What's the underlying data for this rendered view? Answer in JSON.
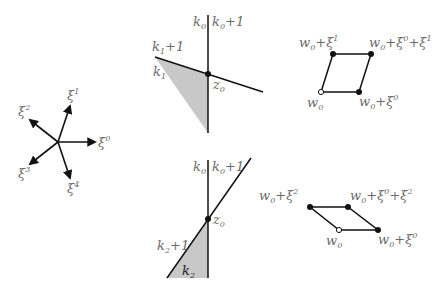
{
  "star": {
    "center": [
      58,
      142
    ],
    "vectors": [
      {
        "name": "ξ",
        "index": "0",
        "tip": [
          96,
          142
        ],
        "label_pos": [
          98,
          147
        ]
      },
      {
        "name": "ξ",
        "index": "1",
        "tip": [
          70,
          105
        ],
        "label_pos": [
          68,
          99
        ]
      },
      {
        "name": "ξ",
        "index": "2",
        "tip": [
          29,
          119
        ],
        "label_pos": [
          17,
          115
        ]
      },
      {
        "name": "ξ",
        "index": "3",
        "tip": [
          29,
          165
        ],
        "label_pos": [
          17,
          178
        ]
      },
      {
        "name": "ξ",
        "index": "4",
        "tip": [
          70,
          179
        ],
        "label_pos": [
          67,
          193
        ]
      }
    ]
  },
  "panel_top": {
    "vertical_label_left": {
      "base": "k",
      "sub": "0"
    },
    "vertical_label_right": {
      "base": "k",
      "sub": "0",
      "suffix": "+1"
    },
    "slant_label_upper": {
      "base": "k",
      "sub": "1",
      "suffix": "+1"
    },
    "slant_label_lower": {
      "base": "k",
      "sub": "1"
    },
    "point_label": {
      "base": "z",
      "sub": "0"
    }
  },
  "panel_bottom": {
    "vertical_label_left": {
      "base": "k",
      "sub": "0"
    },
    "vertical_label_right": {
      "base": "k",
      "sub": "0",
      "suffix": "+1"
    },
    "slant_label_upper": {
      "base": "k",
      "sub": "2",
      "suffix": "+1"
    },
    "slant_label_lower": {
      "base": "k",
      "sub": "2"
    },
    "point_label": {
      "base": "z",
      "sub": "0"
    }
  },
  "para_top": {
    "w0": {
      "text": "w",
      "sub": "0"
    },
    "w0_xi0": {
      "text": "w",
      "sub": "0",
      "rest": "+ξ",
      "sup": "0"
    },
    "w0_xi1": {
      "text": "w",
      "sub": "0",
      "rest": "+ξ",
      "sup": "1"
    },
    "w0_xi0_xi1": {
      "text": "w",
      "sub": "0",
      "rest1": "+ξ",
      "sup1": "0",
      "rest2": "+ξ",
      "sup2": "1"
    }
  },
  "para_bottom": {
    "w0": {
      "text": "w",
      "sub": "0"
    },
    "w0_xi0": {
      "text": "w",
      "sub": "0",
      "rest": "+ξ",
      "sup": "0"
    },
    "w0_xi2": {
      "text": "w",
      "sub": "0",
      "rest": "+ξ",
      "sup": "2"
    },
    "w0_xi0_xi2": {
      "text": "w",
      "sub": "0",
      "rest1": "+ξ",
      "sup1": "0",
      "rest2": "+ξ",
      "sup2": "2"
    }
  },
  "colors": {
    "line": "#111111",
    "shade": "#c8c8c8",
    "label": "#6b6b6b"
  }
}
